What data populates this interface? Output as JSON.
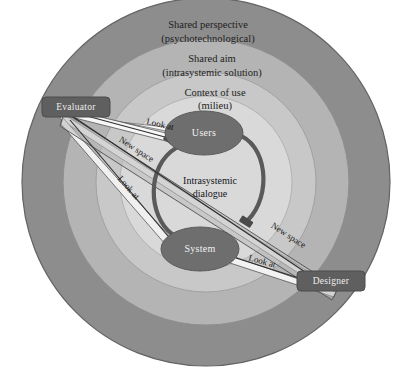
{
  "diagram": {
    "rings": [
      {
        "id": "ring-outer",
        "line1": "Shared perspective",
        "line2": "(psychotechnological)",
        "color": "#8d8d8d"
      },
      {
        "id": "ring-middle",
        "line1": "Shared aim",
        "line2": "(intrasystemic solution)",
        "color": "#b4b4b4"
      },
      {
        "id": "ring-inner",
        "line1": "Context of use",
        "line2": "(milieu)",
        "color": "#c8c8c8"
      },
      {
        "id": "ring-core",
        "line1": "",
        "line2": "",
        "color": "#d9d9d9"
      }
    ],
    "nodes": {
      "users": {
        "label": "Users",
        "color": "#6e6e6e"
      },
      "system": {
        "label": "System",
        "color": "#6e6e6e"
      },
      "evaluator": {
        "label": "Evaluator",
        "color": "#5f5f5f"
      },
      "designer": {
        "label": "Designer",
        "color": "#5f5f5f"
      }
    },
    "center": {
      "line1": "Intrasystemic",
      "line2": "dialogue"
    },
    "edges": [
      {
        "id": "evaluator-users",
        "label": "Look at"
      },
      {
        "id": "evaluator-system",
        "label": "Look at"
      },
      {
        "id": "designer-system",
        "label": "Look at"
      },
      {
        "id": "evaluator-new-space",
        "label": "New space"
      },
      {
        "id": "designer-new-space",
        "label": "New space"
      }
    ],
    "colors": {
      "background": "#ffffff",
      "stroke": "#4f4f4f",
      "arc": "#5a5a5a",
      "wedge_light": "#efefef",
      "wedge_mid": "#bfbfbf",
      "text_dark": "#161616",
      "text_light": "#f0f0f0"
    }
  }
}
